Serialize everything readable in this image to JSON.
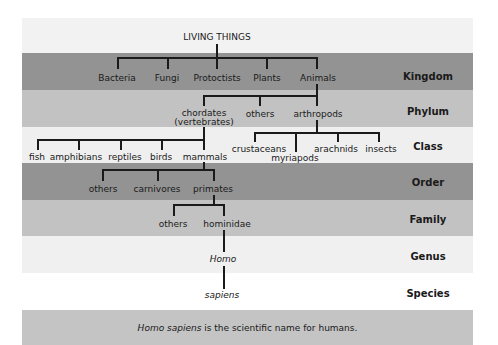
{
  "colors": {
    "top": "#f2f2f2",
    "kingdom": "#939393",
    "phylum": "#c2c2c2",
    "class": "#efefef",
    "order": "#939393",
    "family": "#c2c2c2",
    "genus": "#f0f0f0",
    "species": "#ffffff",
    "footer": "#c4c4c4",
    "lines": "#1a1a1a"
  },
  "root": "LIVING THINGS",
  "ranks": {
    "kingdom": "Kingdom",
    "phylum": "Phylum",
    "class": "Class",
    "order": "Order",
    "family": "Family",
    "genus": "Genus",
    "species": "Species"
  },
  "kingdom": [
    "Bacteria",
    "Fungi",
    "Protoctists",
    "Plants",
    "Animals"
  ],
  "phylum": {
    "chordates": "chordates",
    "chordates_sub": "(vertebrates)",
    "others": "others",
    "arthropods": "arthropods"
  },
  "class": {
    "vertebrates": [
      "fish",
      "amphibians",
      "reptiles",
      "birds",
      "mammals"
    ],
    "arthropods": [
      "crustaceans",
      "myriapods",
      "arachnids",
      "insects"
    ]
  },
  "order": [
    "others",
    "carnivores",
    "primates"
  ],
  "family": [
    "others",
    "hominidae"
  ],
  "genus": "Homo",
  "species": "sapiens",
  "footer": {
    "italic": "Homo sapiens",
    "rest": " is the scientific name for humans."
  }
}
